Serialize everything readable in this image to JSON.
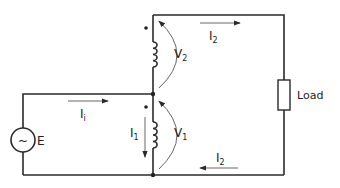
{
  "diagram": {
    "title": "",
    "source": {
      "symbol": "~",
      "label": "E"
    },
    "load": {
      "label": "Load"
    },
    "currents": {
      "input": {
        "main": "I",
        "sub": "i"
      },
      "winding1": {
        "main": "I",
        "sub": "1"
      },
      "output_top": {
        "main": "I",
        "sub": "2"
      },
      "output_bottom": {
        "main": "I",
        "sub": "2"
      }
    },
    "voltages": {
      "v1": {
        "main": "V",
        "sub": "1"
      },
      "v2": {
        "main": "V",
        "sub": "2"
      }
    },
    "colors": {
      "line": "#2a2a2a",
      "background": "#ffffff"
    }
  }
}
